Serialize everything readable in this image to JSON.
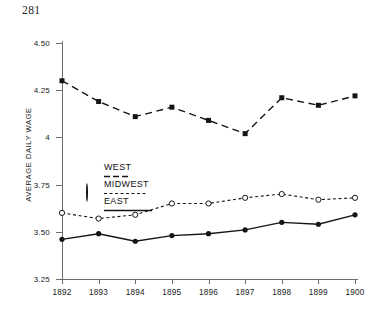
{
  "page": {
    "number": "281"
  },
  "chart_data": {
    "type": "line",
    "title": "",
    "xlabel": "",
    "ylabel": "AVERAGE DAILY WAGE",
    "categories": [
      "1892",
      "1893",
      "1894",
      "1895",
      "1896",
      "1897",
      "1898",
      "1899",
      "1900"
    ],
    "x": [
      1892,
      1893,
      1894,
      1895,
      1896,
      1897,
      1898,
      1899,
      1900
    ],
    "ylim": [
      3.25,
      4.5
    ],
    "yticks": [
      4.5,
      4.25,
      4.0,
      3.75,
      3.5,
      3.25
    ],
    "ytick_labels": [
      "4.50",
      "4.25",
      "4",
      "3.75",
      "3.50",
      "3.25"
    ],
    "grid": false,
    "legend_position": "inside-left",
    "series": [
      {
        "name": "WEST",
        "marker": "filled-square",
        "linestyle": "dashed",
        "color": "#151515",
        "values": [
          4.3,
          4.19,
          4.11,
          4.16,
          4.09,
          4.02,
          4.21,
          4.17,
          4.22
        ]
      },
      {
        "name": "MIDWEST",
        "marker": "open-circle",
        "linestyle": "dotted",
        "color": "#151515",
        "values": [
          3.6,
          3.57,
          3.59,
          3.65,
          3.65,
          3.68,
          3.7,
          3.67,
          3.68
        ]
      },
      {
        "name": "EAST",
        "marker": "filled-circle",
        "linestyle": "solid",
        "color": "#151515",
        "values": [
          3.46,
          3.49,
          3.45,
          3.48,
          3.49,
          3.51,
          3.55,
          3.54,
          3.59
        ]
      }
    ]
  },
  "legend": {
    "items": [
      {
        "label": "WEST"
      },
      {
        "label": "MIDWEST"
      },
      {
        "label": "EAST"
      }
    ]
  }
}
